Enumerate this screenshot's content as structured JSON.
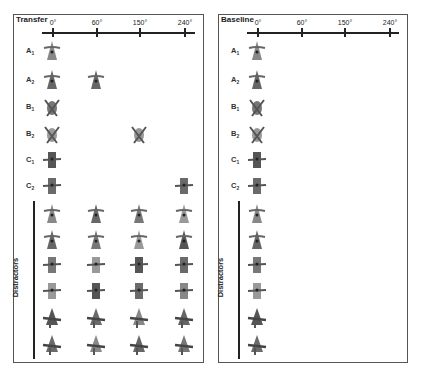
{
  "figure": {
    "panels": [
      {
        "title": "Transfer",
        "angles": [
          "0°",
          "60°",
          "150°",
          "240°"
        ],
        "rows": [
          {
            "label": "A",
            "sub": "1",
            "objects": [
              0
            ]
          },
          {
            "label": "A",
            "sub": "2",
            "objects": [
              0,
              1
            ]
          },
          {
            "label": "B",
            "sub": "1",
            "objects": [
              0
            ]
          },
          {
            "label": "B",
            "sub": "2",
            "objects": [
              0,
              2
            ]
          },
          {
            "label": "C",
            "sub": "1",
            "objects": [
              0
            ]
          },
          {
            "label": "C",
            "sub": "2",
            "objects": [
              0,
              3
            ]
          }
        ],
        "distractor_label": "Distractors",
        "distractor_rows": 6,
        "distractor_cols": [
          0,
          1,
          2,
          3
        ]
      },
      {
        "title": "Baseline",
        "angles": [
          "0°",
          "60°",
          "150°",
          "240°"
        ],
        "rows": [
          {
            "label": "A",
            "sub": "1",
            "objects": [
              0
            ]
          },
          {
            "label": "A",
            "sub": "2",
            "objects": [
              0
            ]
          },
          {
            "label": "B",
            "sub": "1",
            "objects": [
              0
            ]
          },
          {
            "label": "B",
            "sub": "2",
            "objects": [
              0
            ]
          },
          {
            "label": "C",
            "sub": "1",
            "objects": [
              0
            ]
          },
          {
            "label": "C",
            "sub": "2",
            "objects": [
              0
            ]
          }
        ],
        "distractor_label": "Distractors",
        "distractor_rows": 6,
        "distractor_cols": [
          0
        ]
      }
    ]
  }
}
